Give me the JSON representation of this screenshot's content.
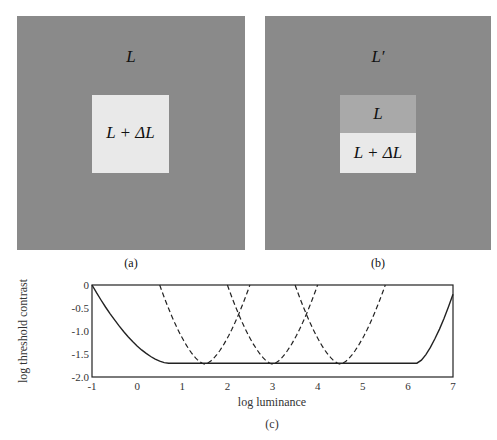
{
  "panels": {
    "a": {
      "caption": "(a)",
      "background_label": "L",
      "target_label": "L + ΔL",
      "background_color": "#8a8a8a",
      "target_color": "#e9e9e9"
    },
    "b": {
      "caption": "(b)",
      "background_label": "L′",
      "top_label": "L",
      "bottom_label": "L + ΔL",
      "background_color": "#8a8a8a",
      "top_color": "#a9a9a9",
      "bottom_color": "#e9e9e9"
    }
  },
  "chart_caption": "(c)",
  "chart_data": {
    "type": "line",
    "title": "",
    "xlabel": "log luminance",
    "ylabel": "log threshold contrast",
    "xlim": [
      -1,
      7
    ],
    "ylim": [
      -2.0,
      0
    ],
    "xticks": [
      "-1",
      "0",
      "1",
      "2",
      "3",
      "4",
      "5",
      "6",
      "7"
    ],
    "yticks": [
      "0",
      "-0.5",
      "-1.0",
      "-1.5",
      "-2.0"
    ],
    "grid": false,
    "series": [
      {
        "name": "envelope (solid)",
        "style": "solid",
        "points": [
          [
            -1,
            0
          ],
          [
            -0.5,
            -0.55
          ],
          [
            0,
            -1.05
          ],
          [
            0.3,
            -1.4
          ],
          [
            0.7,
            -1.7
          ],
          [
            6.2,
            -1.7
          ],
          [
            6.5,
            -1.3
          ],
          [
            6.8,
            -0.8
          ],
          [
            7,
            -0.2
          ]
        ]
      },
      {
        "name": "adapted curve 1 (dashed)",
        "style": "dashed",
        "center": 1.5,
        "points": [
          [
            0.5,
            0
          ],
          [
            1.0,
            -1.3
          ],
          [
            1.4,
            -1.7
          ],
          [
            1.6,
            -1.7
          ],
          [
            2.0,
            -1.3
          ],
          [
            2.5,
            0
          ]
        ]
      },
      {
        "name": "adapted curve 2 (dashed)",
        "style": "dashed",
        "center": 3.0,
        "points": [
          [
            2.0,
            0
          ],
          [
            2.5,
            -1.3
          ],
          [
            2.9,
            -1.7
          ],
          [
            3.1,
            -1.7
          ],
          [
            3.5,
            -1.3
          ],
          [
            4.0,
            0
          ]
        ]
      },
      {
        "name": "adapted curve 3 (dashed)",
        "style": "dashed",
        "center": 4.5,
        "points": [
          [
            3.5,
            0
          ],
          [
            4.0,
            -1.3
          ],
          [
            4.4,
            -1.7
          ],
          [
            4.6,
            -1.7
          ],
          [
            5.0,
            -1.3
          ],
          [
            5.5,
            0
          ]
        ]
      }
    ]
  }
}
